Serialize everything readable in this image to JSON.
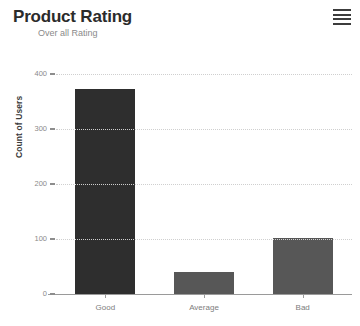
{
  "header": {
    "title": "Product Rating",
    "subtitle": "Over all Rating",
    "menu_icon": "hamburger-menu-icon"
  },
  "chart_data": {
    "type": "bar",
    "title": "Product Rating",
    "subtitle": "Over all Rating",
    "categories": [
      "Good",
      "Average",
      "Bad"
    ],
    "values": [
      372,
      40,
      102
    ],
    "series": [
      {
        "name": "Count of Users",
        "values": [
          372,
          40,
          102
        ]
      }
    ],
    "xlabel": "",
    "ylabel": "Count of Users",
    "ylim": [
      0,
      400
    ],
    "yticks": [
      0,
      100,
      200,
      300,
      400
    ],
    "ytick_labels": [
      "0",
      "100",
      "200",
      "300",
      "400"
    ],
    "grid": true,
    "grid_axis": "y",
    "legend": false,
    "legend_position": "none",
    "bar_colors": [
      "#2e2e2e",
      "#575757",
      "#575757"
    ],
    "background": "#ffffff",
    "axis_color": "#9a9a9a",
    "grid_color": "#cfcfcf"
  }
}
